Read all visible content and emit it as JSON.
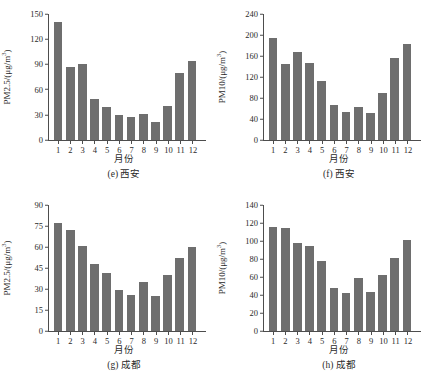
{
  "figure": {
    "background": "#ffffff",
    "bar_color": "#6e6e6e",
    "axis_color": "#4d4d4d",
    "month_ticks": [
      "1",
      "2",
      "3",
      "4",
      "5",
      "6",
      "7",
      "8",
      "9",
      "10",
      "11",
      "12"
    ]
  },
  "chart_data": [
    {
      "id": "e",
      "type": "bar",
      "title": "(e) 西安",
      "caption": "(e) 西安",
      "xlabel": "月份",
      "ylabel_main": "PM2.5/(μg/m",
      "ylabel_sup": "3",
      "ylabel_tail": ")",
      "ylabel": "PM2.5/(μg/m3)",
      "categories": [
        "1",
        "2",
        "3",
        "4",
        "5",
        "6",
        "7",
        "8",
        "9",
        "10",
        "11",
        "12"
      ],
      "values": [
        140,
        87,
        90,
        49,
        39,
        30,
        27,
        31,
        22,
        41,
        80,
        94
      ],
      "ylim": [
        0,
        150
      ],
      "yticks": [
        "0",
        "30",
        "60",
        "90",
        "120",
        "150"
      ],
      "ytickvals": [
        0,
        30,
        60,
        90,
        120,
        150
      ],
      "grid": false,
      "legend": "none"
    },
    {
      "id": "f",
      "type": "bar",
      "title": "(f) 西安",
      "caption": "(f) 西安",
      "xlabel": "月份",
      "ylabel_main": "PM10/(μg/m",
      "ylabel_sup": "3",
      "ylabel_tail": ")",
      "ylabel": "PM10/(μg/m3)",
      "categories": [
        "1",
        "2",
        "3",
        "4",
        "5",
        "6",
        "7",
        "8",
        "9",
        "10",
        "11",
        "12"
      ],
      "values": [
        194,
        145,
        167,
        147,
        112,
        67,
        53,
        63,
        52,
        90,
        157,
        183
      ],
      "ylim": [
        0,
        240
      ],
      "yticks": [
        "0",
        "40",
        "80",
        "120",
        "160",
        "200",
        "240"
      ],
      "ytickvals": [
        0,
        40,
        80,
        120,
        160,
        200,
        240
      ],
      "grid": false,
      "legend": "none"
    },
    {
      "id": "g",
      "type": "bar",
      "title": "(g) 成都",
      "caption": "(g) 成都",
      "xlabel": "月份",
      "ylabel_main": "PM2.5/(μg/m",
      "ylabel_sup": "3",
      "ylabel_tail": ")",
      "ylabel": "PM2.5/(μg/m3)",
      "categories": [
        "1",
        "2",
        "3",
        "4",
        "5",
        "6",
        "7",
        "8",
        "9",
        "10",
        "11",
        "12"
      ],
      "values": [
        77,
        72,
        61,
        48,
        41.5,
        29.5,
        26,
        35,
        25,
        40,
        52,
        60
      ],
      "ylim": [
        0,
        90
      ],
      "yticks": [
        "0",
        "15",
        "30",
        "45",
        "60",
        "75",
        "90"
      ],
      "ytickvals": [
        0,
        15,
        30,
        45,
        60,
        75,
        90
      ],
      "grid": false,
      "legend": "none"
    },
    {
      "id": "h",
      "type": "bar",
      "title": "(h) 成都",
      "caption": "(h) 成都",
      "xlabel": "月份",
      "ylabel_main": "PM10/(μg/m",
      "ylabel_sup": "3",
      "ylabel_tail": ")",
      "ylabel": "PM10/(μg/m3)",
      "categories": [
        "1",
        "2",
        "3",
        "4",
        "5",
        "6",
        "7",
        "8",
        "9",
        "10",
        "11",
        "12"
      ],
      "values": [
        116,
        115,
        98,
        94,
        78,
        48,
        42,
        59,
        43,
        62,
        81,
        101
      ],
      "ylim": [
        0,
        140
      ],
      "yticks": [
        "0",
        "20",
        "40",
        "60",
        "80",
        "100",
        "120",
        "140"
      ],
      "ytickvals": [
        0,
        20,
        40,
        60,
        80,
        100,
        120,
        140
      ],
      "grid": false,
      "legend": "none"
    }
  ]
}
